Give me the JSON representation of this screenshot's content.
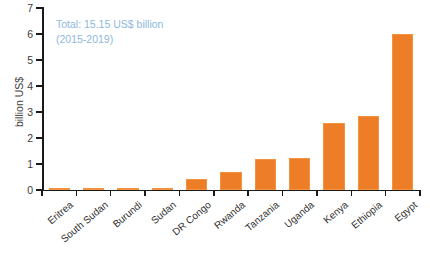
{
  "chart_data": {
    "type": "bar",
    "title": "",
    "xlabel": "",
    "ylabel": "billion US$",
    "ylim": [
      0,
      7
    ],
    "ytick_labels": [
      "0",
      "1",
      "2",
      "3",
      "4",
      "5",
      "6",
      "7"
    ],
    "ytick_values": [
      0,
      1,
      2,
      3,
      4,
      5,
      6,
      7
    ],
    "grid": false,
    "legend_position": "none",
    "bar_color": "#ED7D26",
    "annotation_color": "#8FB8DC",
    "categories": [
      "Eritrea",
      "South Sudan",
      "Burundi",
      "Sudan",
      "DR Congo",
      "Rwanda",
      "Tanzania",
      "Uganda",
      "Kenya",
      "Ethiopia",
      "Egypt"
    ],
    "values": [
      0.01,
      0.03,
      0.09,
      0.08,
      0.42,
      0.68,
      1.19,
      1.22,
      2.58,
      2.85,
      6.0
    ],
    "annotations": [
      "Total: 15.15 US$ billion",
      "(2015-2019)"
    ]
  }
}
